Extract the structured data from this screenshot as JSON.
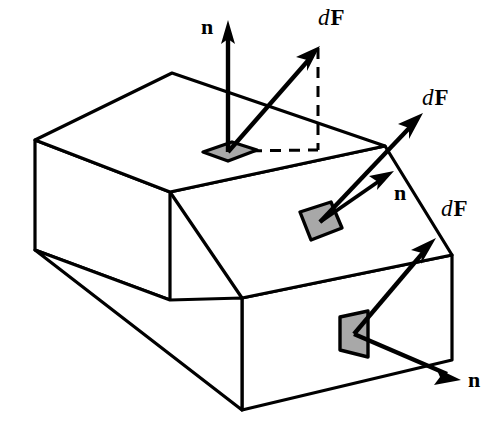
{
  "figure": {
    "domain": "diagram",
    "background_color": "#ffffff",
    "line_color": "#000000",
    "patch_fill_color": "#a8a8a8",
    "canvas": {
      "width": 499,
      "height": 439
    }
  },
  "labels": {
    "top_normal": "n",
    "top_force_d": "d",
    "top_force_F": "F",
    "slant_normal": "n",
    "slant_force_d": "d",
    "slant_force_F": "F",
    "front_normal": "n",
    "front_force_d": "d",
    "front_force_F": "F"
  },
  "elements": {
    "solid_name": "chamfered-block",
    "faces": [
      {
        "name": "top-face",
        "note": "upper horizontal face"
      },
      {
        "name": "slanted-face",
        "note": "inclined chamfer face"
      },
      {
        "name": "front-right-face",
        "note": "lower vertical face facing viewer-right"
      },
      {
        "name": "left-face",
        "note": "left vertical side face"
      }
    ],
    "surface_patches": [
      {
        "name": "patch-top",
        "face": "top-face",
        "normal_direction": "vertical-up",
        "force_direction": "up-right-oblique",
        "has_projection": true
      },
      {
        "name": "patch-slanted",
        "face": "slanted-face",
        "normal_direction": "up-right-perpendicular-to-incline",
        "force_direction": "up-right-steep",
        "has_projection": false
      },
      {
        "name": "patch-front",
        "face": "front-right-face",
        "normal_direction": "down-right-outward",
        "force_direction": "up-right",
        "has_projection": false
      }
    ],
    "projection_lines": {
      "name": "dashed-projection",
      "style": "dashed",
      "note": "vertical drop and horizontal trace showing the in-plane component of dF on the top face"
    }
  }
}
